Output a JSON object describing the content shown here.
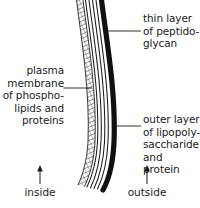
{
  "diagram": {
    "background_color": "#ffffff",
    "ink_color": "#1b1b1b",
    "labels": {
      "peptidoglycan": "thin layer\nof peptido-\nglycan",
      "plasma_membrane": "plasma\nmembrane\nof phospho-\nlipids and\nproteins",
      "outer_layer": "outer layer\nof lipopoly-\nsaccharide\nand protein"
    },
    "orientation": {
      "inside": "inside",
      "outside": "outside"
    },
    "layers": [
      {
        "name": "plasma-membrane-layer",
        "style": "cross-hatched",
        "color": "#3a3a3a",
        "position": "innermost"
      },
      {
        "name": "peptidoglycan-layer",
        "style": "thin-parallel-lines",
        "color": "#1b1b1b",
        "position": "middle"
      },
      {
        "name": "lipopolysaccharide-outer-layer",
        "style": "thick-solid-band",
        "color": "#111111",
        "position": "outermost"
      }
    ]
  }
}
